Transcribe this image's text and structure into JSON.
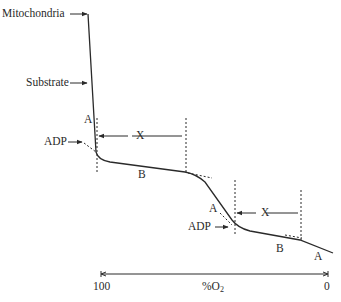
{
  "diagram": {
    "type": "oxygen-consumption-trace",
    "labels": {
      "mitochondria": "Mitochondria",
      "substrate": "Substrate",
      "adp_1": "ADP",
      "adp_2": "ADP",
      "state_a_1": "A",
      "state_b_1": "B",
      "state_a_2": "A",
      "state_b_2": "B",
      "state_a_3": "A",
      "interval_x_1": "X",
      "interval_x_2": "X"
    },
    "axis": {
      "label_main": "%O",
      "label_sub": "2",
      "left_value": "100",
      "right_value": "0"
    },
    "colors": {
      "line": "#2a2a2a",
      "background": "#ffffff"
    }
  }
}
